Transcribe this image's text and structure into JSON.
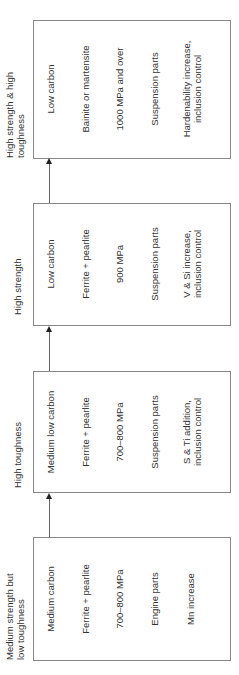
{
  "stages": [
    {
      "label": "High strength & high toughness",
      "label_lines": [
        "High strength & high",
        "toughness"
      ],
      "carbon": "Low carbon",
      "microstructure": "Bainite or martensite",
      "strength": "1000 MPa and over",
      "application": "Suspension parts",
      "measure_lines": [
        "Hardenability increase,",
        "inclusion control"
      ]
    },
    {
      "label": "High strength",
      "label_lines": [
        "High strength"
      ],
      "carbon": "Low carbon",
      "microstructure": "Ferrite + pearlite",
      "strength": "900 MPa",
      "application": "Suspension parts",
      "measure_lines": [
        "V & Si increase,",
        "inclusion control"
      ]
    },
    {
      "label": "High toughness",
      "label_lines": [
        "High toughness"
      ],
      "carbon": "Medium low carbon",
      "microstructure": "Ferrite + pearlite",
      "strength": "700–800 MPa",
      "application": "Suspension parts",
      "measure_lines": [
        "S & Ti addition,",
        "inclusion control"
      ]
    },
    {
      "label": "Medium strength but low toughness",
      "label_lines": [
        "Medium strength but",
        "low toughness"
      ],
      "carbon": "Medium carbon",
      "microstructure": "Ferrite + pearlite",
      "strength": "700–800 MPa",
      "application": "Engine parts",
      "measure_lines": [
        "Mn increase"
      ]
    }
  ],
  "colors": {
    "border": "#888888",
    "text": "#333333",
    "arrow": "#222222"
  }
}
